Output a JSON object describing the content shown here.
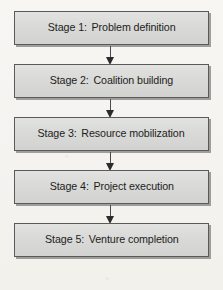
{
  "diagram": {
    "orientation": "vertical-top-to-bottom",
    "colors": {
      "page_background": "#f7f5f2",
      "box_fill": "#dadad8",
      "box_border": "#5a5a5a",
      "box_shadow": "#5a5855",
      "text": "#1d1d1d",
      "arrow": "#2b2b2b"
    },
    "nodes": [
      {
        "key": "Stage 1:",
        "name": "Problem definition",
        "label": "Stage 1:  Problem definition"
      },
      {
        "key": "Stage 2:",
        "name": "Coalition building",
        "label": "Stage 2:  Coalition building"
      },
      {
        "key": "Stage 3:",
        "name": "Resource mobilization",
        "label": "Stage 3:  Resource mobilization"
      },
      {
        "key": "Stage 4:",
        "name": "Project execution",
        "label": "Stage 4:  Project execution"
      },
      {
        "key": "Stage 5:",
        "name": "Venture completion",
        "label": "Stage 5:  Venture completion"
      }
    ],
    "connectors": [
      {
        "from": "Stage 1:",
        "to": "Stage 2:",
        "glyph": "down-arrow"
      },
      {
        "from": "Stage 2:",
        "to": "Stage 3:",
        "glyph": "down-arrow"
      },
      {
        "from": "Stage 3:",
        "to": "Stage 4:",
        "glyph": "down-arrow"
      },
      {
        "from": "Stage 4:",
        "to": "Stage 5:",
        "glyph": "down-arrow"
      }
    ]
  }
}
